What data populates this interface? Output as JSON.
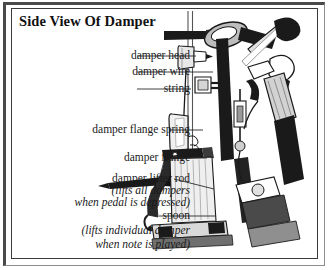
{
  "figure": {
    "title": "Side View Of Damper",
    "background_color": "#ffffff",
    "ink_color": "#1a1a1a",
    "frame_color": "#4a4a4a"
  },
  "labels": [
    {
      "id": "damper-head",
      "text": "damper head",
      "style": "roman",
      "x_right": 133,
      "y": 57,
      "leader_to_x": 196
    },
    {
      "id": "damper-wire",
      "text": "damper wire",
      "style": "roman",
      "x_right": 133,
      "y": 73,
      "leader_to_x": 213
    },
    {
      "id": "string",
      "text": "string",
      "style": "roman",
      "x_right": 133,
      "y": 90,
      "leader_to_x": 191
    },
    {
      "id": "damper-flange-spring",
      "text": "damper flange spring",
      "style": "roman",
      "x_right": 165,
      "y": 131,
      "leader_to_x": 203
    },
    {
      "id": "damper-flange",
      "text": "damper flange",
      "style": "roman",
      "x_right": 165,
      "y": 159,
      "leader_to_x": 207
    },
    {
      "id": "damper-lifter-rod",
      "text": "damper lifter rod",
      "style": "roman",
      "x_right": 170,
      "y": 180,
      "leader_to_x": 214
    },
    {
      "id": "lifter-note-1",
      "text": "(lifts all dampers",
      "style": "italic",
      "x_right": 163,
      "y": 192,
      "leader_to_x": null
    },
    {
      "id": "lifter-note-2",
      "text": "when pedal is depressed)",
      "style": "italic",
      "x_right": 178,
      "y": 204,
      "leader_to_x": null
    },
    {
      "id": "spoon",
      "text": "spoon",
      "style": "roman",
      "x_right": 155,
      "y": 217,
      "leader_to_x": 215
    },
    {
      "id": "spoon-note-1",
      "text": "(lifts individual damper",
      "style": "italic",
      "x_right": 172,
      "y": 232,
      "leader_to_x": null
    },
    {
      "id": "spoon-note-2",
      "text": "when note is played)",
      "style": "italic",
      "x_right": 160,
      "y": 246,
      "leader_to_x": null
    }
  ],
  "parts": [
    {
      "name": "damper head",
      "description": "felt wedge resting on the string near the top of the action"
    },
    {
      "name": "damper wire",
      "description": "vertical wire carrying the damper head"
    },
    {
      "name": "string",
      "description": "piano string running vertically through the view"
    },
    {
      "name": "damper flange spring",
      "description": "spring returning the damper to the string"
    },
    {
      "name": "damper flange",
      "description": "pivot block mounting the damper lever"
    },
    {
      "name": "damper lifter rod",
      "description": "horizontal rod lifting all dampers when the pedal is depressed"
    },
    {
      "name": "spoon",
      "description": "lever lifting an individual damper when its note is played"
    },
    {
      "name": "hammer",
      "description": "hammer shank and head at the right of the action"
    }
  ]
}
